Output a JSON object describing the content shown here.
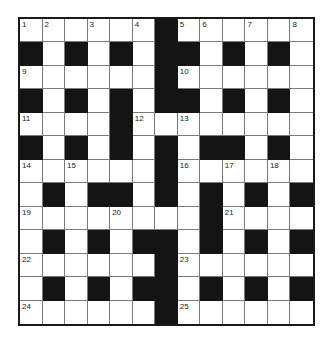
{
  "puzzle": {
    "type": "crossword",
    "rows": 13,
    "cols": 13,
    "colors": {
      "block": "#141414",
      "cell": "#ffffff",
      "gridline": "#7a7a7a",
      "border": "#1a1a1a"
    },
    "layout": [
      "WWWWWWBWWWWWW",
      "BWBWBWBBWBWBW",
      "WWWWWWBWWWWWW",
      "BWBWBWBBWBWBW",
      "WWWWBWWWWWWWW",
      "BWBWBWBWBBWBW",
      "WWWWWWBWWWWWW",
      "WBWBBWBWBWBWB",
      "WWWWWWWWBWWWW",
      "WBWBWBBWBWBWB",
      "WWWWWWBWWWWWW",
      "WBWBWBBWBWBWB",
      "WWWWWWBWWWWWW"
    ],
    "numbers": [
      {
        "n": "1",
        "r": 0,
        "c": 0
      },
      {
        "n": "2",
        "r": 0,
        "c": 1
      },
      {
        "n": "3",
        "r": 0,
        "c": 3
      },
      {
        "n": "4",
        "r": 0,
        "c": 5
      },
      {
        "n": "5",
        "r": 0,
        "c": 7
      },
      {
        "n": "6",
        "r": 0,
        "c": 8
      },
      {
        "n": "7",
        "r": 0,
        "c": 10
      },
      {
        "n": "8",
        "r": 0,
        "c": 12
      },
      {
        "n": "9",
        "r": 2,
        "c": 0
      },
      {
        "n": "10",
        "r": 2,
        "c": 7
      },
      {
        "n": "11",
        "r": 4,
        "c": 0
      },
      {
        "n": "12",
        "r": 4,
        "c": 5
      },
      {
        "n": "13",
        "r": 4,
        "c": 7
      },
      {
        "n": "14",
        "r": 6,
        "c": 0
      },
      {
        "n": "15",
        "r": 6,
        "c": 2
      },
      {
        "n": "16",
        "r": 6,
        "c": 7
      },
      {
        "n": "17",
        "r": 6,
        "c": 9
      },
      {
        "n": "18",
        "r": 6,
        "c": 11
      },
      {
        "n": "19",
        "r": 8,
        "c": 0
      },
      {
        "n": "20",
        "r": 8,
        "c": 4
      },
      {
        "n": "21",
        "r": 8,
        "c": 9
      },
      {
        "n": "22",
        "r": 10,
        "c": 0
      },
      {
        "n": "23",
        "r": 10,
        "c": 7
      },
      {
        "n": "24",
        "r": 12,
        "c": 0
      },
      {
        "n": "25",
        "r": 12,
        "c": 7
      }
    ]
  }
}
